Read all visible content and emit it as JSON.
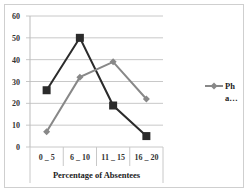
{
  "chart_data": {
    "type": "line",
    "title": "",
    "xlabel": "Percentage of Absentees",
    "ylabel": "",
    "categories": [
      "0 _ 5",
      "6 _ 10",
      "11 _ 15",
      "16 _ 20"
    ],
    "series": [
      {
        "name": "Series A",
        "marker": "square",
        "color": "#2b2b2b",
        "values": [
          26,
          50,
          19,
          5
        ]
      },
      {
        "name": "Ph a…",
        "marker": "diamond",
        "color": "#888888",
        "values": [
          7,
          32,
          39,
          22
        ]
      }
    ],
    "ylim": [
      0,
      60
    ],
    "yticks": [
      0,
      10,
      20,
      30,
      40,
      50,
      60
    ],
    "grid": true,
    "legend": {
      "position": "right",
      "entries": [
        {
          "label_line1": "Ph",
          "label_line2": "a…"
        }
      ]
    }
  }
}
